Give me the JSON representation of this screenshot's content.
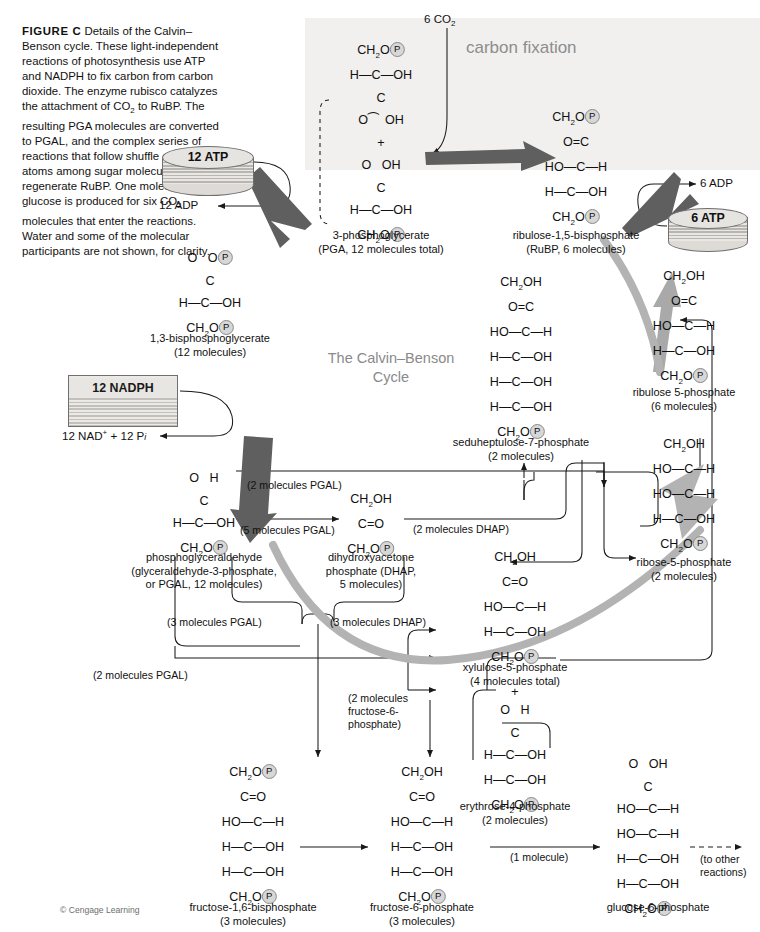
{
  "figure": {
    "label": "FIGURE C",
    "caption": "Details of the Calvin–Benson cycle. These light-independent reactions of photosynthesis use ATP and NADPH to fix carbon from carbon dioxide. The enzyme rubisco catalyzes the attachment of CO2 to RuBP. The resulting PGA molecules are converted to PGAL, and the complex series of reactions that follow shuffle carbon atoms among sugar molecules to regenerate RuBP. One molecule of glucose is produced for six CO2 molecules that enter the reactions. Water and some of the molecular participants are not shown, for clarity.",
    "credit": "© Cengage Learning"
  },
  "panels": {
    "carbon_fixation": "carbon fixation",
    "cycle_title_line1": "The Calvin–Benson",
    "cycle_title_line2": "Cycle"
  },
  "inputs": {
    "co2": "6 CO2",
    "atp_12": "12 ATP",
    "adp_12": "12 ADP",
    "atp_6": "6 ATP",
    "adp_6": "6 ADP",
    "nadph_12": "12 NADPH",
    "nad_pi": "12 NAD+ + 12 Pi"
  },
  "molecules": {
    "pga": {
      "name_line1": "3-phosphoglycerate",
      "name_line2": "(PGA, 12 molecules total)"
    },
    "rubp": {
      "name_line1": "ribulose-1,5-bisphosphate",
      "name_line2": "(RuBP, 6 molecules)"
    },
    "bpg": {
      "name_line1": "1,3-bisphosphoglycerate",
      "name_line2": "(12 molecules)"
    },
    "pgal": {
      "name_line1": "phosphoglyceraldehyde",
      "name_line2": "(glyceraldehyde-3-phosphate,",
      "name_line3": "or PGAL, 12 molecules)"
    },
    "dhap": {
      "name_line1": "dihydroxyacetone",
      "name_line2": "phosphate (DHAP,",
      "name_line3": "5 molecules)"
    },
    "sbp": {
      "name_line1": "seduheptulose-7-phosphate",
      "name_line2": "(2 molecules)"
    },
    "ru5p": {
      "name_line1": "ribulose 5-phosphate",
      "name_line2": "(6 molecules)"
    },
    "r5p": {
      "name_line1": "ribose-5-phosphate",
      "name_line2": "(2 molecules)"
    },
    "xu5p": {
      "name_line1": "xylulose-5-phosphate",
      "name_line2": "(4 molecules total)"
    },
    "e4p": {
      "name_line1": "erythrose-4-phosphate",
      "name_line2": "(2 molecules)"
    },
    "fbp": {
      "name_line1": "fructose-1,6-bisphosphate",
      "name_line2": "(3 molecules)"
    },
    "f6p": {
      "name_line1": "fructose-6-phosphate",
      "name_line2": "(3 molecules)"
    },
    "g6p": {
      "name_line1": "glucose-6-phosphate",
      "name_line2": ""
    }
  },
  "flux_labels": {
    "pgal_2": "(2 molecules PGAL)",
    "pgal_5": "(5 molecules PGAL)",
    "dhap_2": "(2 molecules DHAP)",
    "pgal_3": "(3 molecules PGAL)",
    "dhap_3": "(3 molecules DHAP)",
    "pgal_2b": "(2 molecules PGAL)",
    "f6p_2_l1": "(2 molecules",
    "f6p_2_l2": "fructose-6-",
    "f6p_2_l3": "phosphate)",
    "one_molecule": "(1 molecule)",
    "to_other_l1": "(to other",
    "to_other_l2": "reactions)"
  },
  "colors": {
    "panel_bg": "#f1f0ee",
    "thick_arrow": "#6b6b6b",
    "cycle_arc": "#b3b3b3",
    "label_gray": "#8d8d8d",
    "phosphate": "#d7d7d7"
  }
}
